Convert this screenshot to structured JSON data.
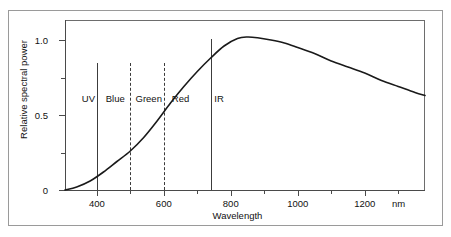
{
  "chart_data": {
    "type": "line",
    "title": "",
    "xlabel": "Wavelength",
    "ylabel": "Relative spectral power",
    "x_unit": "nm",
    "xlim": [
      305,
      1380
    ],
    "ylim": [
      0,
      1.13
    ],
    "grid": false,
    "legend": "none",
    "x_ticks": [
      400,
      600,
      800,
      1000,
      1200
    ],
    "x_tick_labels": [
      "400",
      "600",
      "800",
      "1000",
      "1200"
    ],
    "x_minor_ticks": [
      500,
      700,
      900,
      1100,
      1300
    ],
    "y_ticks": [
      0,
      0.5,
      1.0
    ],
    "y_tick_labels": [
      "0",
      "0.5",
      "1.0"
    ],
    "y_minor_ticks": [
      0.25,
      0.75
    ],
    "series": [
      {
        "name": "Relative spectral power",
        "x": [
          305,
          340,
          380,
          420,
          460,
          500,
          540,
          580,
          620,
          660,
          700,
          740,
          780,
          820,
          850,
          880,
          920,
          960,
          1000,
          1050,
          1100,
          1150,
          1200,
          1250,
          1300,
          1350,
          1380
        ],
        "values": [
          0.0,
          0.02,
          0.06,
          0.12,
          0.19,
          0.26,
          0.35,
          0.46,
          0.58,
          0.69,
          0.79,
          0.88,
          0.96,
          1.01,
          1.02,
          1.015,
          1.0,
          0.98,
          0.95,
          0.91,
          0.86,
          0.82,
          0.78,
          0.73,
          0.69,
          0.65,
          0.63
        ]
      }
    ],
    "bands": [
      {
        "name": "UV",
        "label": "UV",
        "label_x": 375,
        "boundary": null
      },
      {
        "name": "Blue",
        "label": "Blue",
        "label_x": 455,
        "boundary": 400
      },
      {
        "name": "Green",
        "label": "Green",
        "label_x": 555,
        "boundary": 500
      },
      {
        "name": "Red",
        "label": "Red",
        "label_x": 650,
        "boundary": 600
      },
      {
        "name": "IR",
        "label": "IR",
        "label_x": 765,
        "boundary": 740
      }
    ],
    "band_dividers": [
      {
        "at": 400,
        "style": "solid",
        "top_value": 0.85
      },
      {
        "at": 500,
        "style": "dashed",
        "top_value": 0.85
      },
      {
        "at": 600,
        "style": "dashed",
        "top_value": 0.85
      },
      {
        "at": 740,
        "style": "solid",
        "top_value": 1.01
      }
    ],
    "annotations": {
      "peak_value": 1.02,
      "peak_wavelength": 850
    },
    "colors": {
      "curve": "#1a1a1a",
      "axis": "#4a4a4a",
      "divider": "#3c3c3c",
      "frame": "#9a9a9a",
      "text": "#111111",
      "background": "#ffffff"
    }
  }
}
